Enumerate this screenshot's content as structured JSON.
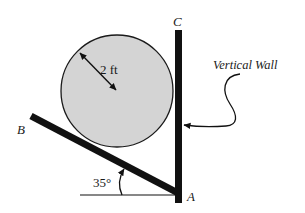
{
  "diagram": {
    "type": "statics-free-body-setup",
    "labels": {
      "point_c": "C",
      "point_b": "B",
      "point_a": "A",
      "radius": "2 ft",
      "angle": "35°",
      "wall": "Vertical Wall"
    },
    "elements": {
      "cylinder": {
        "center": [
          117,
          91
        ],
        "radius": 56,
        "fill": "#d4d4d4",
        "stroke": "#1a1a1a"
      },
      "wall": {
        "x": 175,
        "y": 30,
        "width": 7,
        "height": 173,
        "color": "#111111"
      },
      "bar_AB": {
        "from": [
          31,
          116
        ],
        "to": [
          178,
          193
        ],
        "thickness": 7,
        "color": "#111111"
      },
      "ground_line": {
        "from": [
          80,
          195
        ],
        "to": [
          176,
          195
        ]
      },
      "angle_deg": 35
    },
    "colors": {
      "ink": "#111111",
      "cylinder_fill": "#d4d4d4",
      "background": "#ffffff"
    }
  }
}
